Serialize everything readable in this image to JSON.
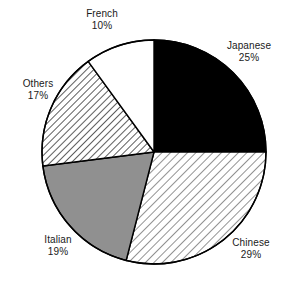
{
  "chart_data": {
    "type": "pie",
    "title": "",
    "subtitle": "",
    "xlabel": "",
    "ylabel": "",
    "legend_position": "none",
    "grid": false,
    "value_unit": "%",
    "start_angle_deg": 0,
    "direction": "clockwise",
    "categories": [
      "Japanese",
      "Chinese",
      "Italian",
      "Others",
      "French"
    ],
    "values": [
      25,
      29,
      19,
      17,
      10
    ],
    "slices": [
      {
        "label": "Japanese",
        "value": 25,
        "value_text": "25%",
        "fill_style": "solid-black",
        "color": "#000000",
        "start_deg": 0.0,
        "end_deg": 90.0
      },
      {
        "label": "Chinese",
        "value": 29,
        "value_text": "29%",
        "fill_style": "diagonal-hatch-light",
        "color": "#e8e8e8",
        "start_deg": 90.0,
        "end_deg": 194.4
      },
      {
        "label": "Italian",
        "value": 19,
        "value_text": "19%",
        "fill_style": "solid-gray",
        "color": "#909090",
        "start_deg": 194.4,
        "end_deg": 262.8
      },
      {
        "label": "Others",
        "value": 17,
        "value_text": "17%",
        "fill_style": "diagonal-hatch-medium",
        "color": "#d0d0d0",
        "start_deg": 262.8,
        "end_deg": 324.0
      },
      {
        "label": "French",
        "value": 10,
        "value_text": "10%",
        "fill_style": "none-white",
        "color": "#ffffff",
        "start_deg": 324.0,
        "end_deg": 360.0
      }
    ],
    "outline_color": "#000000",
    "text_color": "#1a1a1a",
    "background": "#ffffff",
    "geometry": {
      "cx": 154,
      "cy": 152,
      "r": 112
    }
  },
  "labels": {
    "japanese": {
      "name": "Japanese",
      "value": "25%"
    },
    "chinese": {
      "name": "Chinese",
      "value": "29%"
    },
    "italian": {
      "name": "Italian",
      "value": "19%"
    },
    "others": {
      "name": "Others",
      "value": "17%"
    },
    "french": {
      "name": "French",
      "value": "10%"
    }
  }
}
